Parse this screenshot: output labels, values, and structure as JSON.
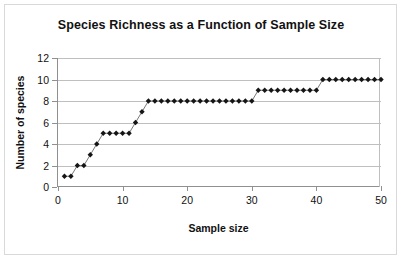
{
  "chart_data": {
    "type": "scatter",
    "title": "Species Richness as a Function of Sample Size",
    "xlabel": "Sample size",
    "ylabel": "Number of species",
    "xlim": [
      0,
      50
    ],
    "ylim": [
      0,
      12
    ],
    "xticks": [
      0,
      10,
      20,
      30,
      40,
      50
    ],
    "yticks": [
      0,
      2,
      4,
      6,
      8,
      10,
      12
    ],
    "grid": "horizontal",
    "legend": "none",
    "marker": "diamond",
    "marker_color": "#151515",
    "x": [
      1,
      2,
      3,
      4,
      5,
      6,
      7,
      8,
      9,
      10,
      11,
      12,
      13,
      14,
      15,
      16,
      17,
      18,
      19,
      20,
      21,
      22,
      23,
      24,
      25,
      26,
      27,
      28,
      29,
      30,
      31,
      32,
      33,
      34,
      35,
      36,
      37,
      38,
      39,
      40,
      41,
      42,
      43,
      44,
      45,
      46,
      47,
      48,
      49,
      50
    ],
    "values": [
      1,
      1,
      2,
      2,
      3,
      4,
      5,
      5,
      5,
      5,
      5,
      6,
      7,
      8,
      8,
      8,
      8,
      8,
      8,
      8,
      8,
      8,
      8,
      8,
      8,
      8,
      8,
      8,
      8,
      8,
      9,
      9,
      9,
      9,
      9,
      9,
      9,
      9,
      9,
      9,
      10,
      10,
      10,
      10,
      10,
      10,
      10,
      10,
      10,
      10
    ]
  },
  "colors": {
    "marker": "#151515",
    "gridline": "#bfbfbf",
    "axis": "#909090",
    "frame_border": "#d9d9d9",
    "text": "#111111"
  }
}
